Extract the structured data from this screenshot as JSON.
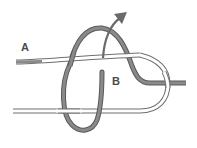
{
  "diagram": {
    "type": "knot-tying-step",
    "labels": {
      "a": "A",
      "b": "B"
    },
    "colors": {
      "white_rope_fill": "#ffffff",
      "white_rope_outline": "#6e6e6e",
      "gray_rope_fill": "#8a8a8a",
      "gray_rope_outline": "#5a5a5a",
      "arrow": "#6a6a6a",
      "background": "#ffffff"
    },
    "elements": [
      {
        "name": "white-rope",
        "description": "Light rope strand with end A, looping around on the right"
      },
      {
        "name": "gray-rope",
        "description": "Dark rope wrapping around the white rope, ending at B"
      },
      {
        "name": "direction-arrow",
        "description": "Arrow indicating pulling direction up and to the right"
      }
    ]
  }
}
